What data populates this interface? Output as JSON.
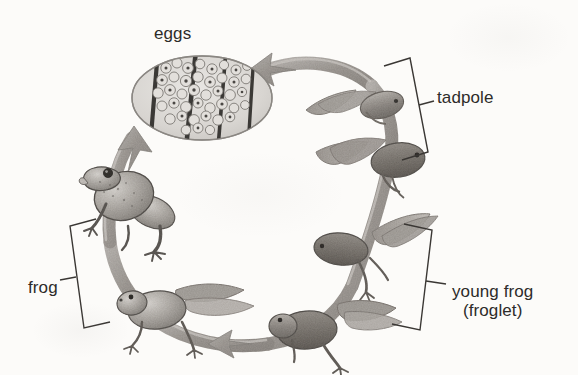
{
  "diagram": {
    "background_color": "#fcfbf9",
    "ink_color": "#2d2b29",
    "style": "grayscale scanned illustration",
    "flow_direction": "counterclockwise",
    "labels": {
      "eggs": "eggs",
      "tadpole": "tadpole",
      "frog": "frog",
      "young_frog_line1": "young frog",
      "young_frog_line2": "(froglet)"
    },
    "stages": [
      {
        "id": "eggs",
        "name": "eggs",
        "description": "oval egg mass with dark vertical reed stripes and round spotted eggs",
        "position": "top-left"
      },
      {
        "id": "early-tadpole",
        "name": "early tadpole",
        "description": "small legless tadpole with long tail",
        "position": "top-right"
      },
      {
        "id": "late-tadpole",
        "name": "late tadpole",
        "description": "larger tadpole with tail",
        "position": "right-upper"
      },
      {
        "id": "tadpole-with-legs",
        "name": "tadpole with hind legs",
        "description": "tadpole with developing hind legs and tail",
        "position": "right-lower"
      },
      {
        "id": "froglet",
        "name": "young frog (froglet)",
        "description": "froglet with four legs and a shrinking tail",
        "position": "bottom-right"
      },
      {
        "id": "frog-young",
        "name": "froglet near adult",
        "description": "froglet with short tail and full legs",
        "position": "bottom-left"
      },
      {
        "id": "adult-frog",
        "name": "adult frog",
        "description": "adult frog sitting upright, no tail",
        "position": "left"
      }
    ],
    "brackets": [
      {
        "id": "tadpole-bracket",
        "label": "tadpole",
        "side": "right-top"
      },
      {
        "id": "young-frog-bracket",
        "label": "young frog (froglet)",
        "side": "right-bottom"
      },
      {
        "id": "frog-bracket",
        "label": "frog",
        "side": "left-bottom"
      }
    ],
    "arrows": [
      {
        "id": "arrow-top",
        "points_to": "eggs",
        "direction": "left"
      },
      {
        "id": "arrow-left",
        "points_to": "eggs",
        "direction": "up"
      },
      {
        "id": "arrow-bottom",
        "points_to": "frog",
        "direction": "left"
      }
    ]
  }
}
